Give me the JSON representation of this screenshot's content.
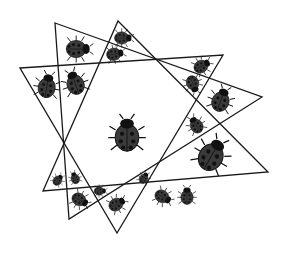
{
  "diagram": {
    "stroke_color": "#1a1a1a",
    "bug_color": "#3a3a3a",
    "bug_dark": "#111111",
    "triangles": [
      {
        "id": "triangle-1",
        "points": [
          [
            55,
            23
          ],
          [
            262,
            97
          ],
          [
            69,
            219
          ]
        ]
      },
      {
        "id": "triangle-2",
        "points": [
          [
            118,
            21
          ],
          [
            268,
            172
          ],
          [
            43,
            191
          ]
        ]
      },
      {
        "id": "triangle-3",
        "points": [
          [
            20,
            68
          ],
          [
            223,
            55
          ],
          [
            117,
            233
          ]
        ]
      }
    ],
    "ladybugs": [
      {
        "x": 78,
        "y": 49,
        "size": "medium",
        "heading": 90
      },
      {
        "x": 123,
        "y": 38,
        "size": "small",
        "heading": 90
      },
      {
        "x": 115,
        "y": 54,
        "size": "small",
        "heading": 80
      },
      {
        "x": 47,
        "y": 86,
        "size": "medium",
        "heading": 10
      },
      {
        "x": 75,
        "y": 83,
        "size": "medium",
        "heading": -20
      },
      {
        "x": 202,
        "y": 66,
        "size": "small",
        "heading": 60
      },
      {
        "x": 193,
        "y": 84,
        "size": "small",
        "heading": 160
      },
      {
        "x": 221,
        "y": 100,
        "size": "medium",
        "heading": 20
      },
      {
        "x": 127,
        "y": 135,
        "size": "large",
        "heading": 0
      },
      {
        "x": 196,
        "y": 125,
        "size": "small",
        "heading": -30
      },
      {
        "x": 212,
        "y": 155,
        "size": "large",
        "heading": 30
      },
      {
        "x": 58,
        "y": 180,
        "size": "tiny",
        "heading": 40
      },
      {
        "x": 75,
        "y": 178,
        "size": "tiny",
        "heading": -20
      },
      {
        "x": 100,
        "y": 191,
        "size": "tiny",
        "heading": 90
      },
      {
        "x": 80,
        "y": 200,
        "size": "small",
        "heading": 120
      },
      {
        "x": 117,
        "y": 204,
        "size": "small",
        "heading": 60
      },
      {
        "x": 144,
        "y": 178,
        "size": "tiny",
        "heading": 30
      },
      {
        "x": 163,
        "y": 197,
        "size": "small",
        "heading": 120
      },
      {
        "x": 187,
        "y": 196,
        "size": "small",
        "heading": 0
      }
    ]
  }
}
